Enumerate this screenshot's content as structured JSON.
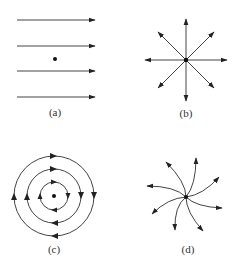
{
  "figure": {
    "panels": [
      {
        "id": "a",
        "label": "(a)",
        "description": "uniform field: parallel horizontal arrows pointing right, point charge dot between lines"
      },
      {
        "id": "b",
        "label": "(b)",
        "description": "radial field: eight straight arrows pointing outward from a central dot"
      },
      {
        "id": "c",
        "label": "(c)",
        "description": "circulating field: three concentric circles with clockwise arrows around a central dot"
      },
      {
        "id": "d",
        "label": "(d)",
        "description": "spiral field: eight curved arrows spiraling outward from a central dot"
      }
    ],
    "colors": {
      "stroke": "#333333",
      "background": "#ffffff"
    }
  }
}
